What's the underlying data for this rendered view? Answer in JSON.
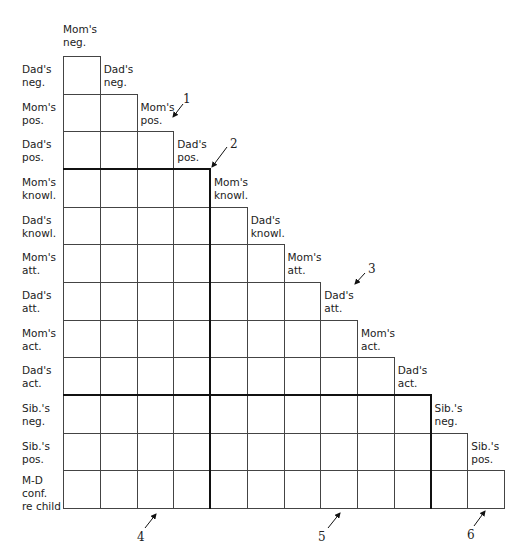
{
  "diagram": {
    "type": "lower-triangular correlation matrix",
    "variables": [
      "Mom's\nneg.",
      "Dad's\nneg.",
      "Mom's\npos.",
      "Dad's\npos.",
      "Mom's\nknowl.",
      "Dad's\nknowl.",
      "Mom's\natt.",
      "Dad's\natt.",
      "Mom's\nact.",
      "Dad's\nact.",
      "Sib.'s\nneg.",
      "Sib.'s\npos.",
      "M-D\nconf.\nre child"
    ],
    "row_labels": [
      "Dad's\nneg.",
      "Mom's\npos.",
      "Dad's\npos.",
      "Mom's\nknowl.",
      "Dad's\nknowl.",
      "Mom's\natt.",
      "Dad's\natt.",
      "Mom's\nact.",
      "Dad's\nact.",
      "Sib.'s\nneg.",
      "Sib.'s\npos.",
      "M-D\nconf.\nre child"
    ],
    "block_dividers": {
      "after_row": [
        3,
        9
      ],
      "after_column": [
        4,
        10
      ]
    },
    "annotations": [
      {
        "label": "1",
        "x": 183,
        "y": 92
      },
      {
        "label": "2",
        "x": 230,
        "y": 137
      },
      {
        "label": "3",
        "x": 368,
        "y": 262
      },
      {
        "label": "4",
        "x": 137,
        "y": 530
      },
      {
        "label": "5",
        "x": 318,
        "y": 530
      },
      {
        "label": "6",
        "x": 467,
        "y": 528
      }
    ]
  }
}
